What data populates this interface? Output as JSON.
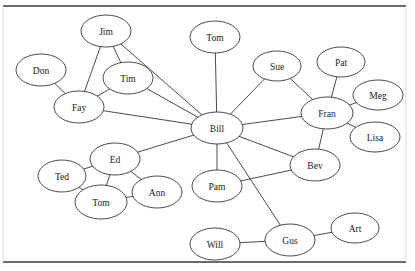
{
  "diagram": {
    "node_shape": "ellipse",
    "node_fill": "#ffffff",
    "node_stroke": "#2b2b2b",
    "edge_color": "#2b2b2b",
    "background": "#ffffff",
    "frame": {
      "top_y": 6,
      "bottom_y": 262,
      "left_x": 3,
      "right_x": 406
    },
    "nodes": [
      {
        "id": "jim",
        "label": "Jim",
        "x": 106,
        "y": 31,
        "rx": 25,
        "ry": 16
      },
      {
        "id": "tomtop",
        "label": "Tom",
        "x": 215,
        "y": 37,
        "rx": 25,
        "ry": 16
      },
      {
        "id": "don",
        "label": "Don",
        "x": 41,
        "y": 70,
        "rx": 25,
        "ry": 16
      },
      {
        "id": "tim",
        "label": "Tim",
        "x": 128,
        "y": 78,
        "rx": 25,
        "ry": 16
      },
      {
        "id": "sue",
        "label": "Sue",
        "x": 277,
        "y": 66,
        "rx": 24,
        "ry": 15
      },
      {
        "id": "pat",
        "label": "Pat",
        "x": 341,
        "y": 62,
        "rx": 24,
        "ry": 15
      },
      {
        "id": "fay",
        "label": "Fay",
        "x": 79,
        "y": 107,
        "rx": 25,
        "ry": 16
      },
      {
        "id": "bill",
        "label": "Bill",
        "x": 217,
        "y": 128,
        "rx": 26,
        "ry": 16
      },
      {
        "id": "fran",
        "label": "Fran",
        "x": 327,
        "y": 113,
        "rx": 26,
        "ry": 16
      },
      {
        "id": "meg",
        "label": "Meg",
        "x": 378,
        "y": 95,
        "rx": 25,
        "ry": 15
      },
      {
        "id": "lisa",
        "label": "Lisa",
        "x": 375,
        "y": 137,
        "rx": 25,
        "ry": 15
      },
      {
        "id": "ed",
        "label": "Ed",
        "x": 115,
        "y": 159,
        "rx": 25,
        "ry": 16
      },
      {
        "id": "bev",
        "label": "Bev",
        "x": 315,
        "y": 165,
        "rx": 25,
        "ry": 16
      },
      {
        "id": "ted",
        "label": "Ted",
        "x": 62,
        "y": 176,
        "rx": 24,
        "ry": 16
      },
      {
        "id": "ann",
        "label": "Ann",
        "x": 157,
        "y": 192,
        "rx": 25,
        "ry": 16
      },
      {
        "id": "pam",
        "label": "Pam",
        "x": 217,
        "y": 186,
        "rx": 25,
        "ry": 16
      },
      {
        "id": "tombot",
        "label": "Tom",
        "x": 101,
        "y": 202,
        "rx": 26,
        "ry": 17
      },
      {
        "id": "gus",
        "label": "Gus",
        "x": 290,
        "y": 240,
        "rx": 25,
        "ry": 16
      },
      {
        "id": "art",
        "label": "Art",
        "x": 355,
        "y": 228,
        "rx": 24,
        "ry": 15
      },
      {
        "id": "will",
        "label": "Will",
        "x": 215,
        "y": 244,
        "rx": 25,
        "ry": 16
      }
    ],
    "edges": [
      {
        "from": "jim",
        "to": "tim"
      },
      {
        "from": "jim",
        "to": "fay"
      },
      {
        "from": "jim",
        "to": "bill"
      },
      {
        "from": "don",
        "to": "fay"
      },
      {
        "from": "tim",
        "to": "fay"
      },
      {
        "from": "tim",
        "to": "bill"
      },
      {
        "from": "fay",
        "to": "bill"
      },
      {
        "from": "tomtop",
        "to": "bill"
      },
      {
        "from": "sue",
        "to": "bill"
      },
      {
        "from": "sue",
        "to": "fran"
      },
      {
        "from": "pat",
        "to": "fran"
      },
      {
        "from": "meg",
        "to": "fran"
      },
      {
        "from": "lisa",
        "to": "fran"
      },
      {
        "from": "fran",
        "to": "bill"
      },
      {
        "from": "fran",
        "to": "bev"
      },
      {
        "from": "bev",
        "to": "bill"
      },
      {
        "from": "bev",
        "to": "pam"
      },
      {
        "from": "pam",
        "to": "bill"
      },
      {
        "from": "gus",
        "to": "bill"
      },
      {
        "from": "gus",
        "to": "will"
      },
      {
        "from": "gus",
        "to": "art"
      },
      {
        "from": "ed",
        "to": "bill"
      },
      {
        "from": "ed",
        "to": "ted"
      },
      {
        "from": "ed",
        "to": "ann"
      },
      {
        "from": "ed",
        "to": "tombot"
      },
      {
        "from": "ted",
        "to": "tombot"
      },
      {
        "from": "tombot",
        "to": "ann"
      }
    ]
  }
}
